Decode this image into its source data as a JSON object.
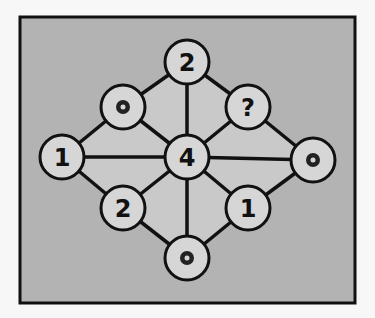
{
  "puzzle": {
    "type": "number-diamond-graph",
    "frame": {
      "x": 20,
      "y": 17,
      "width": 335,
      "height": 286
    },
    "colors": {
      "page_bg": "#f7f7f7",
      "frame_bg": "#b3b3b3",
      "frame_border": "#111111",
      "inner_fill": "#c9c9c9",
      "node_fill": "#d6d6d6",
      "edge": "#111111",
      "dot_outer": "#222222",
      "dot_inner": "#d6d6d6"
    },
    "node_radius": 22,
    "nodes": [
      {
        "id": "top",
        "x": 187,
        "y": 62,
        "kind": "number",
        "label": "2"
      },
      {
        "id": "upper-left",
        "x": 123,
        "y": 107,
        "kind": "dot",
        "label": ""
      },
      {
        "id": "upper-right",
        "x": 248,
        "y": 107,
        "kind": "question",
        "label": "?"
      },
      {
        "id": "left",
        "x": 62,
        "y": 157,
        "kind": "number",
        "label": "1"
      },
      {
        "id": "center",
        "x": 187,
        "y": 157,
        "kind": "number",
        "label": "4"
      },
      {
        "id": "right",
        "x": 313,
        "y": 160,
        "kind": "dot",
        "label": ""
      },
      {
        "id": "lower-left",
        "x": 123,
        "y": 208,
        "kind": "number",
        "label": "2"
      },
      {
        "id": "lower-right",
        "x": 248,
        "y": 208,
        "kind": "number",
        "label": "1"
      },
      {
        "id": "bottom",
        "x": 187,
        "y": 258,
        "kind": "dot",
        "label": ""
      }
    ],
    "edges": [
      [
        "top",
        "upper-left"
      ],
      [
        "top",
        "upper-right"
      ],
      [
        "top",
        "center"
      ],
      [
        "upper-left",
        "left"
      ],
      [
        "upper-left",
        "center"
      ],
      [
        "upper-right",
        "center"
      ],
      [
        "upper-right",
        "right"
      ],
      [
        "left",
        "center"
      ],
      [
        "center",
        "right"
      ],
      [
        "left",
        "lower-left"
      ],
      [
        "lower-left",
        "center"
      ],
      [
        "lower-left",
        "bottom"
      ],
      [
        "center",
        "bottom"
      ],
      [
        "center",
        "lower-right"
      ],
      [
        "lower-right",
        "right"
      ],
      [
        "lower-right",
        "bottom"
      ]
    ],
    "shaded_polygon": [
      "top",
      "upper-right",
      "right",
      "lower-right",
      "bottom",
      "lower-left",
      "left",
      "upper-left"
    ]
  }
}
